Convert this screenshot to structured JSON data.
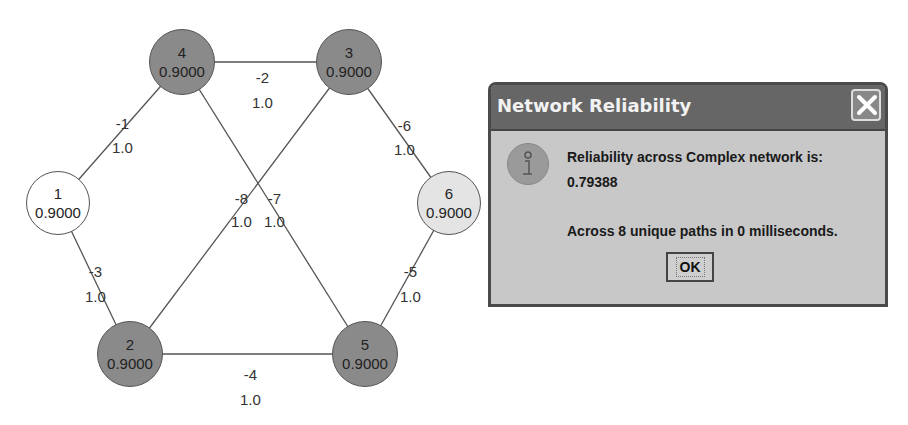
{
  "graph": {
    "nodes": [
      {
        "id": "4",
        "reliability": "0.9000",
        "shade": "dark"
      },
      {
        "id": "3",
        "reliability": "0.9000",
        "shade": "dark"
      },
      {
        "id": "1",
        "reliability": "0.9000",
        "shade": "white"
      },
      {
        "id": "6",
        "reliability": "0.9000",
        "shade": "light"
      },
      {
        "id": "2",
        "reliability": "0.9000",
        "shade": "dark"
      },
      {
        "id": "5",
        "reliability": "0.9000",
        "shade": "dark"
      }
    ],
    "edges": [
      {
        "id": "-1",
        "from": "4",
        "to": "1",
        "weight": "1.0"
      },
      {
        "id": "-2",
        "from": "4",
        "to": "3",
        "weight": "1.0"
      },
      {
        "id": "-3",
        "from": "1",
        "to": "2",
        "weight": "1.0"
      },
      {
        "id": "-4",
        "from": "2",
        "to": "5",
        "weight": "1.0"
      },
      {
        "id": "-5",
        "from": "6",
        "to": "5",
        "weight": "1.0"
      },
      {
        "id": "-6",
        "from": "3",
        "to": "6",
        "weight": "1.0"
      },
      {
        "id": "-7",
        "from": "4",
        "to": "5",
        "weight": "1.0"
      },
      {
        "id": "-8",
        "from": "3",
        "to": "2",
        "weight": "1.0"
      }
    ]
  },
  "dialog": {
    "title": "Network Reliability",
    "icon": "info-icon",
    "close_icon": "close-icon",
    "message_line1": "Reliability across Complex network is:",
    "reliability_value": "0.79388",
    "message_line2": "Across 8 unique paths in 0 milliseconds.",
    "ok_label": "OK"
  }
}
